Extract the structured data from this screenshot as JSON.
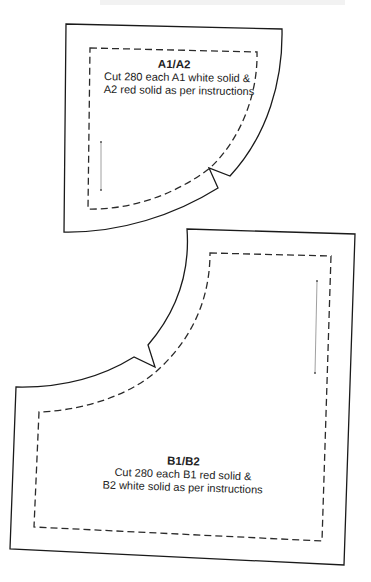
{
  "page": {
    "type": "quilt template pattern pieces"
  },
  "pieces": [
    {
      "id": "A",
      "title": "A1/A2",
      "line1": "Cut 280 each A1 white solid &",
      "line2": "A2 red solid as per instructions",
      "has_notch": true,
      "has_grainline": true
    },
    {
      "id": "B",
      "title": "B1/B2",
      "line1": "Cut 280 each B1 red solid &",
      "line2": "B2 white solid as per instructions",
      "has_notch": true,
      "has_grainline": true
    }
  ],
  "colors": {
    "cut_line": "#1a1a1a",
    "seam_line": "#2a2a2a",
    "grain_line": "#888888",
    "text": "#222222",
    "background": "#ffffff"
  }
}
